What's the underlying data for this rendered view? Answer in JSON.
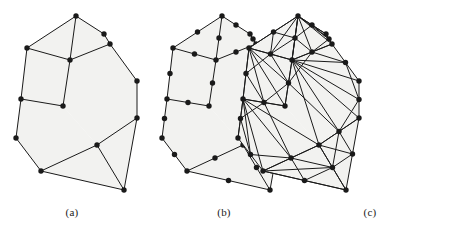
{
  "figure": {
    "width": 450,
    "height": 231,
    "background_color": "#ffffff",
    "face_fill_color": "#f2f2f0",
    "edge_color": "#1a1a1a",
    "node_color": "#1a1a1a",
    "node_radius": 2.7,
    "edge_width": 1.0
  },
  "panels": [
    {
      "id": "panel-a",
      "caption": "(a)",
      "caption_x": 72,
      "caption_y": 206,
      "offset_x": 0,
      "offset_y": 0,
      "description": "coarse polygonal mesh with corner vertices only",
      "node_count": 13,
      "edge_count": 17,
      "nodes": [
        [
          76,
          16
        ],
        [
          110,
          44
        ],
        [
          70,
          60
        ],
        [
          27,
          48
        ],
        [
          21,
          99
        ],
        [
          63,
          106
        ],
        [
          137,
          81
        ],
        [
          137,
          118
        ],
        [
          16,
          138
        ],
        [
          41,
          171
        ],
        [
          97,
          145
        ],
        [
          124,
          190
        ],
        [
          104,
          34
        ]
      ],
      "edges": [
        [
          0,
          12
        ],
        [
          12,
          1
        ],
        [
          0,
          2
        ],
        [
          0,
          3
        ],
        [
          3,
          2
        ],
        [
          2,
          1
        ],
        [
          1,
          6
        ],
        [
          6,
          7
        ],
        [
          3,
          4
        ],
        [
          4,
          5
        ],
        [
          5,
          2
        ],
        [
          4,
          8
        ],
        [
          8,
          9
        ],
        [
          9,
          10
        ],
        [
          10,
          7
        ],
        [
          10,
          11
        ],
        [
          9,
          11
        ],
        [
          11,
          7
        ]
      ]
    },
    {
      "id": "panel-b",
      "caption": "(b)",
      "caption_x": 224,
      "caption_y": 206,
      "offset_x": 146,
      "offset_y": 0,
      "description": "same mesh with an added midpoint vertex on every edge",
      "node_count": 31,
      "edge_count": 36,
      "midpoints_added": true
    },
    {
      "id": "panel-c",
      "caption": "(c)",
      "caption_x": 370,
      "caption_y": 206,
      "offset_x": 222,
      "offset_y": 0,
      "description": "fully triangulated mesh built on the refined vertex set",
      "node_count": 31,
      "triangulated": true,
      "extra_edges": [
        [
          0,
          5
        ],
        [
          0,
          4
        ],
        [
          2,
          4
        ],
        [
          2,
          3
        ],
        [
          3,
          5
        ],
        [
          5,
          1
        ],
        [
          2,
          6
        ],
        [
          2,
          7
        ],
        [
          5,
          4
        ],
        [
          4,
          8
        ],
        [
          5,
          8
        ],
        [
          5,
          9
        ],
        [
          5,
          10
        ],
        [
          2,
          10
        ],
        [
          10,
          6
        ],
        [
          10,
          1
        ],
        [
          10,
          9
        ],
        [
          9,
          8
        ],
        [
          10,
          11
        ],
        [
          9,
          11
        ],
        [
          8,
          10
        ]
      ]
    }
  ]
}
